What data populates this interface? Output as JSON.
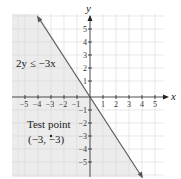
{
  "diagram": {
    "type": "inequality-graph",
    "inequality_label": "2y ≤ −3x",
    "boundary_line": {
      "equation": "y = -1.5x",
      "style": "solid",
      "arrows": "both"
    },
    "shaded_region": "below-left of line",
    "axes": {
      "x_label": "x",
      "y_label": "y",
      "x_ticks": [
        "−5",
        "−4",
        "−3",
        "−2",
        "−1",
        "1",
        "2",
        "3",
        "4",
        "5"
      ],
      "y_ticks": [
        "5",
        "4",
        "3",
        "2",
        "1",
        "−1",
        "−2",
        "−3",
        "−4",
        "−5"
      ]
    },
    "test_point": {
      "label_line1": "Test point",
      "label_line2": "(−3, −3)",
      "x": -3,
      "y": -3
    },
    "colors": {
      "shade": "#e9e9e9",
      "grid": "#d8d8d8",
      "line": "#555555",
      "axis": "#222222"
    }
  }
}
